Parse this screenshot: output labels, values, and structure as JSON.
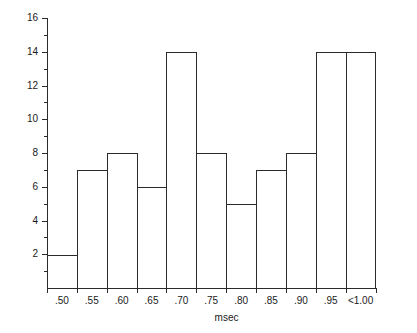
{
  "chart_data": {
    "type": "bar",
    "title": "",
    "subtitle": "",
    "xlabel": "msec",
    "ylabel": "",
    "categories": [
      ".50",
      ".55",
      ".60",
      ".65",
      ".70",
      ".75",
      ".80",
      ".85",
      ".90",
      ".95",
      "<1.00"
    ],
    "values": [
      2,
      7,
      8,
      6,
      14,
      8,
      5,
      7,
      8,
      14,
      14
    ],
    "ylim": [
      0,
      16
    ],
    "yticks": [
      0,
      2,
      4,
      6,
      8,
      10,
      12,
      14,
      16
    ],
    "ytick_labels": [
      "",
      "2",
      "4",
      "6",
      "8",
      "10",
      "12",
      "14",
      "16"
    ],
    "yminor_ticks": [
      1,
      3,
      5,
      7,
      9,
      11,
      13,
      15
    ],
    "grid": false,
    "legend": null,
    "bar_style": "outline",
    "line_color": "#2b2b2b",
    "fill_color": "#ffffff",
    "background": "#ffffff"
  },
  "axes": {
    "y_labels": [
      {
        "value": 16,
        "text": "16"
      },
      {
        "value": 14,
        "text": "14"
      },
      {
        "value": 12,
        "text": "12"
      },
      {
        "value": 10,
        "text": "10"
      },
      {
        "value": 8,
        "text": "8"
      },
      {
        "value": 6,
        "text": "6"
      },
      {
        "value": 4,
        "text": "4"
      },
      {
        "value": 2,
        "text": "2"
      }
    ],
    "x_labels": [
      {
        "text": ".50"
      },
      {
        "text": ".55"
      },
      {
        "text": ".60"
      },
      {
        "text": ".65"
      },
      {
        "text": ".70"
      },
      {
        "text": ".75"
      },
      {
        "text": ".80"
      },
      {
        "text": ".85"
      },
      {
        "text": ".90"
      },
      {
        "text": ".95"
      },
      {
        "text": "<1.00"
      }
    ],
    "x_axis_title": "msec"
  }
}
